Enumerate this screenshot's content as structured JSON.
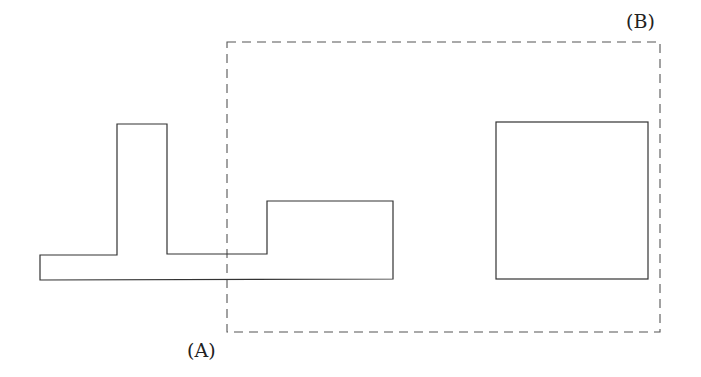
{
  "diagram": {
    "labels": {
      "a": "(A)",
      "b": "(B)"
    },
    "colors": {
      "stroke": "#333333",
      "dashed_stroke": "#555555",
      "background": "#ffffff"
    },
    "shapes": {
      "polygon_a": {
        "description": "L/T-shaped outline composed of a base bar, a tall tower and a raised block",
        "points": [
          [
            40,
            255
          ],
          [
            117,
            255
          ],
          [
            117,
            124
          ],
          [
            167,
            124
          ],
          [
            167,
            254
          ],
          [
            267,
            254
          ],
          [
            267,
            201
          ],
          [
            393,
            201
          ],
          [
            393,
            279
          ],
          [
            40,
            280
          ]
        ]
      },
      "square_b": {
        "x": 496,
        "y": 122,
        "width": 152,
        "height": 157
      },
      "dashed_region_b": {
        "x": 227,
        "y": 42,
        "width": 433,
        "height": 290
      }
    }
  }
}
